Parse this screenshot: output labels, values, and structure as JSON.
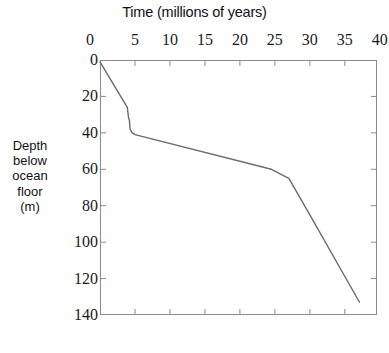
{
  "chart_data": {
    "type": "line",
    "title": "Time (millions of years)",
    "xlabel": "Time (millions of years)",
    "ylabel": "Depth below ocean floor (m)",
    "ylabel_lines": [
      "Depth",
      "below",
      "ocean",
      "floor",
      "(m)"
    ],
    "xlim": [
      0,
      39.6
    ],
    "ylim": [
      140,
      0
    ],
    "y_inverted": true,
    "grid": false,
    "legend": null,
    "x_ticks": [
      0,
      5,
      10,
      15,
      20,
      25,
      30,
      35,
      40
    ],
    "x_tick_labels": [
      "0",
      "5",
      "10",
      "15",
      "20",
      "25",
      "30",
      "35",
      "40"
    ],
    "x_tick_position": "top",
    "y_ticks": [
      0,
      20,
      40,
      60,
      80,
      100,
      120,
      140
    ],
    "y_tick_labels": [
      "0",
      "20",
      "40",
      "60",
      "80",
      "100",
      "120",
      "140"
    ],
    "y_tick_position": "left",
    "series": [
      {
        "name": "Sediment accumulation",
        "color": "#6b6b6b",
        "x": [
          0,
          3.9,
          4.1,
          4.2,
          4.3,
          4.6,
          5.0,
          24.5,
          27.0,
          30.0,
          37.1
        ],
        "y": [
          1,
          26,
          32,
          33,
          38,
          40,
          41,
          60,
          65,
          85,
          133
        ]
      }
    ]
  },
  "style": {
    "axis_color": "#8a8a8a",
    "line_color": "#6b6b6b",
    "text_color": "#1a1a1a",
    "background": "#ffffff"
  }
}
